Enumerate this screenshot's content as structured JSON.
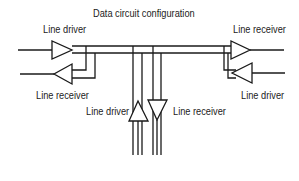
{
  "title": "Data circuit configuration",
  "labels": {
    "left_driver": "Line driver",
    "left_receiver": "Line receiver",
    "right_receiver": "Line receiver",
    "right_driver": "Line driver",
    "bottom_driver": "Line driver",
    "bottom_receiver": "Line receiver"
  },
  "components": [
    {
      "type": "line-driver",
      "position": "left-top",
      "direction": "right"
    },
    {
      "type": "line-receiver",
      "position": "left-bottom",
      "direction": "left"
    },
    {
      "type": "line-receiver",
      "position": "right-top",
      "direction": "right"
    },
    {
      "type": "line-driver",
      "position": "right-bottom",
      "direction": "left"
    },
    {
      "type": "line-driver",
      "position": "bottom-center-left",
      "direction": "up"
    },
    {
      "type": "line-receiver",
      "position": "bottom-center-right",
      "direction": "down"
    }
  ]
}
